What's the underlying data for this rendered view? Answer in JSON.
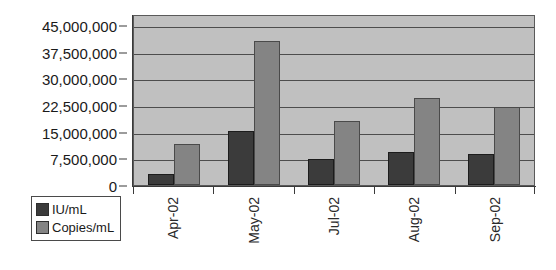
{
  "chart_data": {
    "type": "bar",
    "title": "",
    "subtitle": "",
    "xlabel": "",
    "ylabel": "",
    "categories": [
      "Apr-02",
      "May-02",
      "Jul-02",
      "Aug-02",
      "Sep-02"
    ],
    "series": [
      {
        "name": "IU/mL",
        "color": "#3b3b3b",
        "values": [
          3100000,
          15200000,
          7300000,
          9300000,
          8700000
        ]
      },
      {
        "name": "Copies/mL",
        "color": "#848484",
        "values": [
          11500000,
          40500000,
          18000000,
          24500000,
          22000000
        ]
      }
    ],
    "ylim": [
      0,
      45000000
    ],
    "ytick_values": [
      0,
      7500000,
      15000000,
      22500000,
      30000000,
      37500000,
      45000000
    ],
    "ytick_labels": [
      "0",
      "7,500,000",
      "15,000,000",
      "22,500,000",
      "30,000,000",
      "37,500,000",
      "45,000,000"
    ],
    "grid": true,
    "legend_position": "bottom-left",
    "legend_entries": [
      "IU/mL",
      "Copies/mL"
    ],
    "plot_background": "#c0c0c0",
    "gridline_color": "#4d4d4d",
    "axis_color": "#3a3a3a",
    "annotations": []
  }
}
